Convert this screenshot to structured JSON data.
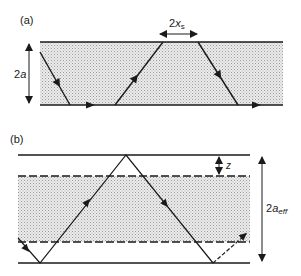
{
  "panel_a": {
    "label": "(a)",
    "height_label_prefix": "2",
    "height_label_var": "a",
    "shift_label_prefix": "2",
    "shift_label_var": "x",
    "shift_label_sub": "s"
  },
  "panel_b": {
    "label": "(b)",
    "penetration_label": "z",
    "eff_label_prefix": "2",
    "eff_label_var": "a",
    "eff_label_sub": "eff"
  },
  "colors": {
    "line": "#1a1a1a",
    "shade": "#c8c8c8",
    "background": "#ffffff"
  }
}
